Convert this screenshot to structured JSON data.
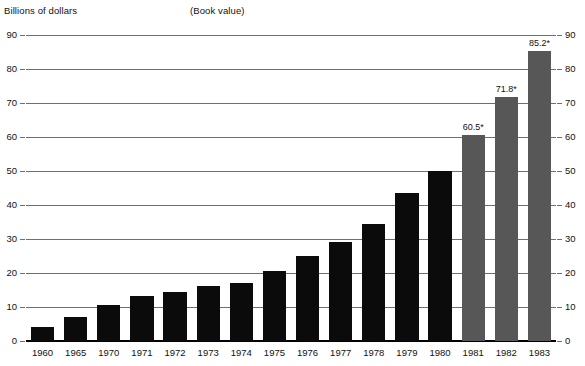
{
  "header": {
    "y_axis_title": "Billions of dollars",
    "note": "(Book value)"
  },
  "chart_data": {
    "type": "bar",
    "title": "Billions of dollars",
    "subtitle": "(Book value)",
    "xlabel": "",
    "ylabel": "Billions of dollars",
    "ylim": [
      0,
      90
    ],
    "yticks": [
      0,
      10,
      20,
      30,
      40,
      50,
      60,
      70,
      80,
      90
    ],
    "grid": true,
    "legend": "none",
    "dual_axis": true,
    "categories": [
      "1960",
      "1965",
      "1970",
      "1971",
      "1972",
      "1973",
      "1974",
      "1975",
      "1976",
      "1977",
      "1978",
      "1979",
      "1980",
      "1981",
      "1982",
      "1983"
    ],
    "values": [
      4.0,
      7.0,
      10.7,
      13.2,
      14.3,
      16.2,
      17.2,
      20.5,
      25.0,
      29.0,
      34.5,
      43.5,
      50.0,
      60.5,
      71.8,
      85.2
    ],
    "data_labels": [
      "",
      "",
      "",
      "",
      "",
      "",
      "",
      "",
      "",
      "",
      "",
      "",
      "",
      "60.5*",
      "71.8*",
      "85.2*"
    ],
    "series_colors": {
      "actual": "#0b0b0b",
      "projected": "#575757"
    },
    "projected_categories": [
      "1981",
      "1982",
      "1983"
    ]
  }
}
